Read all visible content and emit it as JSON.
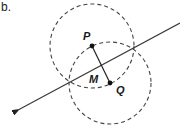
{
  "part_label": "b.",
  "points": {
    "P": {
      "label": "P",
      "x": 92,
      "y": 46
    },
    "Q": {
      "label": "Q",
      "x": 110,
      "y": 83
    },
    "M": {
      "label": "M"
    }
  },
  "circles": [
    {
      "name": "circle-centered-P",
      "cx": 92,
      "cy": 46,
      "r": 42,
      "style": "dashed"
    },
    {
      "name": "circle-centered-Q",
      "cx": 110,
      "cy": 83,
      "r": 41,
      "style": "dashed"
    }
  ],
  "line": {
    "description": "perpendicular bisector through circle intersections",
    "from": [
      180,
      23
    ],
    "to": [
      16,
      111
    ],
    "arrow_end": "bottom-left"
  },
  "segment": {
    "from": "P",
    "to": "Q"
  },
  "colors": {
    "stroke": "#3a3a3a",
    "dash": "#444444"
  }
}
